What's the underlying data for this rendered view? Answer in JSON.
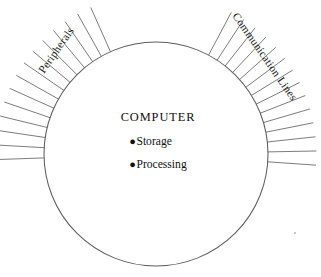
{
  "diagram": {
    "type": "computer-system-boundary-diagram",
    "background_color": "#ffffff",
    "circle": {
      "label": "computer-boundary",
      "center_x": 156,
      "center_y": 154,
      "radius": 112,
      "stroke_color": "#5d5d5d",
      "fill_color": "#ffffff"
    },
    "center_text": {
      "title": "COMPUTER",
      "bullet_glyph": "●",
      "items": [
        {
          "label": "Storage"
        },
        {
          "label": "Processing"
        }
      ]
    },
    "edge_labels": [
      {
        "key": "peripherals",
        "text": "Peripherals",
        "rotation_deg": -55,
        "x": 44,
        "y": 74,
        "color": "#1a1a1a"
      },
      {
        "key": "communication_lines",
        "text": "Communication Lines",
        "rotation_deg": 55,
        "x": 232,
        "y": 16,
        "color": "#1a1a1a"
      }
    ],
    "fans": [
      {
        "key": "left-fan",
        "name": "peripherals-connector-lines",
        "count": 14,
        "start_angle_deg": 182,
        "end_angle_deg": 114,
        "inner_radius": 112,
        "outer_radius": 160,
        "stroke_color": "#6d6d6d"
      },
      {
        "key": "right-fan",
        "name": "communication-connector-lines",
        "count": 14,
        "start_angle_deg": 62,
        "end_angle_deg": -4,
        "inner_radius": 112,
        "outer_radius": 160,
        "stroke_color": "#6d6d6d"
      }
    ],
    "artifact": {
      "name": "scan-speck",
      "x": 294,
      "y": 232
    }
  }
}
